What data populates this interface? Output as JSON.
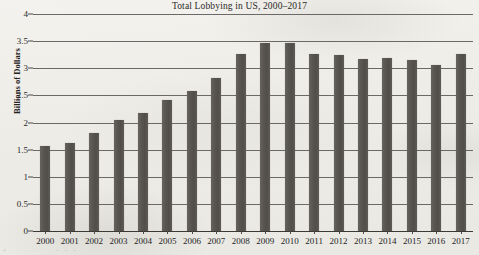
{
  "chart_data": {
    "type": "bar",
    "title": "Total Lobbying in US, 2000–2017",
    "xlabel": "",
    "ylabel": "Billions of Dollars",
    "ylim": [
      0,
      4
    ],
    "ytick_step": 0.5,
    "grid": true,
    "legend": false,
    "bar_color": "#5a5753",
    "categories": [
      "2000",
      "2001",
      "2002",
      "2003",
      "2004",
      "2005",
      "2006",
      "2007",
      "2008",
      "2009",
      "2010",
      "2011",
      "2012",
      "2013",
      "2014",
      "2015",
      "2016",
      "2017"
    ],
    "values": [
      1.56,
      1.62,
      1.81,
      2.04,
      2.18,
      2.42,
      2.58,
      2.82,
      3.26,
      3.47,
      3.47,
      3.27,
      3.25,
      3.17,
      3.19,
      3.15,
      3.06,
      3.27
    ],
    "ytick_labels": [
      "0",
      "0.5",
      "1",
      "1.5",
      "2",
      "2.5",
      "3",
      "3.5",
      "4"
    ],
    "ytick_values": [
      0,
      0.5,
      1,
      1.5,
      2,
      2.5,
      3,
      3.5,
      4
    ]
  },
  "artifacts": {
    "bleed_left": "◦",
    "bleed_mid": "···"
  }
}
